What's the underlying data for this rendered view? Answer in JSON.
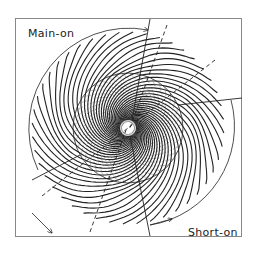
{
  "diagram": {
    "type": "spiral-field-diagram",
    "labels": {
      "main_on": "Main-on",
      "short_on": "Short-on"
    },
    "colors": {
      "line": "#222222",
      "frame": "#888888",
      "background": "#ffffff"
    },
    "geometry": {
      "frame": {
        "x": 15,
        "y": 18,
        "width": 227,
        "height": 219
      },
      "center": [
        128,
        128
      ],
      "inner_circle_radius": 55,
      "arrow_arc_radius": 100,
      "field_line_count": 44
    }
  }
}
